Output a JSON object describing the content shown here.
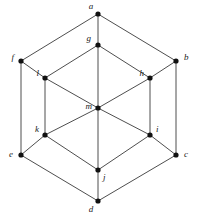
{
  "figure": {
    "background_color": "#ffffff",
    "edge_color": "#3a3a3a",
    "vertex_color": "#111111",
    "label_color": "#1a1a1a",
    "width": 197,
    "height": 220
  },
  "chart_data": {
    "type": "diagram",
    "xlabel": "",
    "ylabel": "",
    "node_count": 13,
    "edge_count": 24,
    "nodes": [
      {
        "id": "a",
        "label": "a",
        "x": 98,
        "y": 14,
        "label_dx": -7,
        "label_dy": -7,
        "anchor": "middle"
      },
      {
        "id": "b",
        "label": "b",
        "x": 176,
        "y": 61,
        "label_dx": 8,
        "label_dy": -3,
        "anchor": "start"
      },
      {
        "id": "c",
        "label": "c",
        "x": 176,
        "y": 155,
        "label_dx": 8,
        "label_dy": 0,
        "anchor": "start"
      },
      {
        "id": "d",
        "label": "d",
        "x": 98,
        "y": 201,
        "label_dx": -7,
        "label_dy": 9,
        "anchor": "middle"
      },
      {
        "id": "e",
        "label": "e",
        "x": 21,
        "y": 155,
        "label_dx": -8,
        "label_dy": 0,
        "anchor": "end"
      },
      {
        "id": "f",
        "label": "f",
        "x": 21,
        "y": 61,
        "label_dx": -7,
        "label_dy": -3,
        "anchor": "end"
      },
      {
        "id": "g",
        "label": "g",
        "x": 98,
        "y": 45,
        "label_dx": -7,
        "label_dy": -6,
        "anchor": "end"
      },
      {
        "id": "h",
        "label": "h",
        "x": 150,
        "y": 78,
        "label_dx": -6,
        "label_dy": -4,
        "anchor": "end"
      },
      {
        "id": "i",
        "label": "i",
        "x": 150,
        "y": 135,
        "label_dx": 6,
        "label_dy": -5,
        "anchor": "start"
      },
      {
        "id": "j",
        "label": "j",
        "x": 98,
        "y": 170,
        "label_dx": 5,
        "label_dy": 8,
        "anchor": "start"
      },
      {
        "id": "k",
        "label": "k",
        "x": 45,
        "y": 135,
        "label_dx": -6,
        "label_dy": -5,
        "anchor": "end"
      },
      {
        "id": "l",
        "label": "l",
        "x": 45,
        "y": 78,
        "label_dx": -6,
        "label_dy": -4,
        "anchor": "end"
      },
      {
        "id": "m",
        "label": "m",
        "x": 98,
        "y": 108,
        "label_dx": -6,
        "label_dy": -1,
        "anchor": "end"
      }
    ],
    "edges": [
      {
        "from": "a",
        "to": "f"
      },
      {
        "from": "a",
        "to": "b"
      },
      {
        "from": "a",
        "to": "g"
      },
      {
        "from": "f",
        "to": "e"
      },
      {
        "from": "f",
        "to": "l"
      },
      {
        "from": "b",
        "to": "c"
      },
      {
        "from": "b",
        "to": "h"
      },
      {
        "from": "e",
        "to": "d"
      },
      {
        "from": "e",
        "to": "k"
      },
      {
        "from": "c",
        "to": "d"
      },
      {
        "from": "c",
        "to": "i"
      },
      {
        "from": "d",
        "to": "j"
      },
      {
        "from": "g",
        "to": "l"
      },
      {
        "from": "g",
        "to": "h"
      },
      {
        "from": "g",
        "to": "m"
      },
      {
        "from": "l",
        "to": "m"
      },
      {
        "from": "l",
        "to": "k"
      },
      {
        "from": "h",
        "to": "m"
      },
      {
        "from": "h",
        "to": "i"
      },
      {
        "from": "m",
        "to": "k"
      },
      {
        "from": "m",
        "to": "i"
      },
      {
        "from": "m",
        "to": "j"
      },
      {
        "from": "k",
        "to": "j"
      },
      {
        "from": "i",
        "to": "j"
      }
    ],
    "vertex_radius": 2.6
  }
}
